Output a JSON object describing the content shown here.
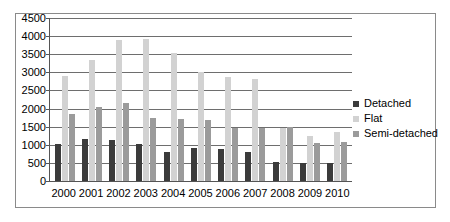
{
  "chart_data": {
    "type": "bar",
    "title": "",
    "subtitle": "",
    "xlabel": "",
    "ylabel": "",
    "ylim": [
      0,
      4500
    ],
    "ytick_step": 500,
    "yticks": [
      4500,
      4000,
      3500,
      3000,
      2500,
      2000,
      1500,
      1000,
      500,
      0
    ],
    "categories": [
      "2000",
      "2001",
      "2002",
      "2003",
      "2004",
      "2005",
      "2006",
      "2007",
      "2008",
      "2009",
      "2010"
    ],
    "grid": true,
    "legend_position": "right",
    "series": [
      {
        "name": "Detached",
        "color": "#3b3b3b",
        "values": [
          1010,
          1170,
          1140,
          1010,
          810,
          920,
          880,
          790,
          520,
          510,
          490
        ]
      },
      {
        "name": "Flat",
        "color": "#d2d2d2",
        "values": [
          2890,
          3330,
          3880,
          3930,
          3530,
          3010,
          2860,
          2830,
          1460,
          1230,
          1350
        ]
      },
      {
        "name": "Semi-detached",
        "color": "#9b9b9b",
        "values": [
          1840,
          2050,
          2160,
          1750,
          1710,
          1690,
          1450,
          1450,
          1480,
          1060,
          1070
        ]
      }
    ]
  },
  "legend": {
    "items": [
      {
        "label": "Detached",
        "key": "detached"
      },
      {
        "label": "Flat",
        "key": "flat"
      },
      {
        "label": "Semi-detached",
        "key": "semi"
      }
    ]
  }
}
